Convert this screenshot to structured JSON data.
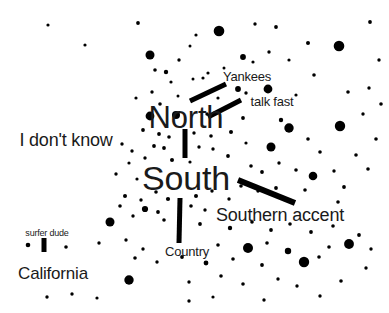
{
  "figure": {
    "title": "",
    "background_color": "#ffffff",
    "text_color": "#1a1a1a",
    "dot_color": "#000000",
    "line_color": "#000000",
    "width": 389,
    "height": 313
  },
  "chart_data": {
    "type": "scatter",
    "title": "",
    "subtitle": "",
    "xlabel": "",
    "ylabel": "",
    "xlim": [
      0,
      389
    ],
    "ylim": [
      0,
      313
    ],
    "grid": false,
    "legend": null,
    "annotations": [
      {
        "text": "North",
        "x": 186,
        "y": 117,
        "font_size": 31,
        "weight": 400
      },
      {
        "text": "South",
        "x": 186,
        "y": 178,
        "font_size": 34,
        "weight": 400
      },
      {
        "text": "Yankees",
        "x": 247,
        "y": 76,
        "font_size": 13,
        "weight": 400
      },
      {
        "text": "talk fast",
        "x": 272,
        "y": 101,
        "font_size": 13,
        "weight": 400
      },
      {
        "text": "Southern accent",
        "x": 280,
        "y": 215,
        "font_size": 18,
        "weight": 400
      },
      {
        "text": "I don't know",
        "x": 66,
        "y": 140,
        "font_size": 18,
        "weight": 400
      },
      {
        "text": "Country",
        "x": 187,
        "y": 251,
        "font_size": 13,
        "weight": 400
      },
      {
        "text": "California",
        "x": 53,
        "y": 273,
        "font_size": 17,
        "weight": 400
      },
      {
        "text": "surfer dude",
        "x": 47,
        "y": 233,
        "font_size": 9,
        "weight": 400
      }
    ],
    "leader_lines": [
      {
        "name": "yankees-leader",
        "x1": 190,
        "y1": 101,
        "x2": 226,
        "y2": 84,
        "width": 5
      },
      {
        "name": "talk-fast-leader",
        "x1": 208,
        "y1": 117,
        "x2": 241,
        "y2": 100,
        "width": 5
      },
      {
        "name": "north-south-leader",
        "x1": 185,
        "y1": 129,
        "x2": 185,
        "y2": 158,
        "width": 5
      },
      {
        "name": "southern-accent-leader",
        "x1": 238,
        "y1": 180,
        "x2": 295,
        "y2": 203,
        "width": 6
      },
      {
        "name": "country-leader",
        "x1": 180,
        "y1": 198,
        "x2": 179,
        "y2": 243,
        "width": 5
      },
      {
        "name": "surfer-dude-leader",
        "x1": 44,
        "y1": 238,
        "x2": 44,
        "y2": 252,
        "width": 5
      }
    ],
    "points": [
      {
        "x": 48,
        "y": 25,
        "r": 1.6
      },
      {
        "x": 85,
        "y": 45,
        "r": 1.6
      },
      {
        "x": 138,
        "y": 23,
        "r": 1.9
      },
      {
        "x": 150,
        "y": 55,
        "r": 4.5
      },
      {
        "x": 179,
        "y": 60,
        "r": 1.7
      },
      {
        "x": 196,
        "y": 35,
        "r": 1.6
      },
      {
        "x": 219,
        "y": 31,
        "r": 5.3
      },
      {
        "x": 166,
        "y": 72,
        "r": 2.2
      },
      {
        "x": 190,
        "y": 46,
        "r": 1.5
      },
      {
        "x": 203,
        "y": 78,
        "r": 1.6
      },
      {
        "x": 255,
        "y": 24,
        "r": 1.7
      },
      {
        "x": 276,
        "y": 27,
        "r": 1.9
      },
      {
        "x": 308,
        "y": 43,
        "r": 2.0
      },
      {
        "x": 339,
        "y": 46,
        "r": 5.3
      },
      {
        "x": 370,
        "y": 22,
        "r": 1.9
      },
      {
        "x": 243,
        "y": 57,
        "r": 2.9
      },
      {
        "x": 253,
        "y": 62,
        "r": 1.6
      },
      {
        "x": 269,
        "y": 52,
        "r": 1.7
      },
      {
        "x": 289,
        "y": 60,
        "r": 1.6
      },
      {
        "x": 314,
        "y": 75,
        "r": 1.8
      },
      {
        "x": 379,
        "y": 60,
        "r": 1.7
      },
      {
        "x": 155,
        "y": 70,
        "r": 1.8
      },
      {
        "x": 171,
        "y": 82,
        "r": 1.6
      },
      {
        "x": 193,
        "y": 79,
        "r": 1.5
      },
      {
        "x": 208,
        "y": 73,
        "r": 1.6
      },
      {
        "x": 224,
        "y": 68,
        "r": 1.5
      },
      {
        "x": 238,
        "y": 89,
        "r": 2.9
      },
      {
        "x": 246,
        "y": 93,
        "r": 1.7
      },
      {
        "x": 268,
        "y": 89,
        "r": 4.4
      },
      {
        "x": 152,
        "y": 92,
        "r": 1.7
      },
      {
        "x": 136,
        "y": 98,
        "r": 1.6
      },
      {
        "x": 160,
        "y": 104,
        "r": 1.8
      },
      {
        "x": 178,
        "y": 96,
        "r": 1.5
      },
      {
        "x": 218,
        "y": 98,
        "r": 1.6
      },
      {
        "x": 296,
        "y": 95,
        "r": 1.6
      },
      {
        "x": 348,
        "y": 92,
        "r": 1.8
      },
      {
        "x": 369,
        "y": 88,
        "r": 1.7
      },
      {
        "x": 381,
        "y": 104,
        "r": 1.8
      },
      {
        "x": 150,
        "y": 116,
        "r": 4.4
      },
      {
        "x": 176,
        "y": 115,
        "r": 4.0
      },
      {
        "x": 207,
        "y": 114,
        "r": 1.7
      },
      {
        "x": 243,
        "y": 118,
        "r": 1.9
      },
      {
        "x": 281,
        "y": 120,
        "r": 2.2
      },
      {
        "x": 289,
        "y": 128,
        "r": 4.7
      },
      {
        "x": 340,
        "y": 126,
        "r": 5.2
      },
      {
        "x": 363,
        "y": 114,
        "r": 1.7
      },
      {
        "x": 143,
        "y": 130,
        "r": 1.9
      },
      {
        "x": 159,
        "y": 134,
        "r": 1.9
      },
      {
        "x": 169,
        "y": 137,
        "r": 1.8
      },
      {
        "x": 194,
        "y": 133,
        "r": 1.7
      },
      {
        "x": 211,
        "y": 136,
        "r": 1.8
      },
      {
        "x": 231,
        "y": 132,
        "r": 2.0
      },
      {
        "x": 246,
        "y": 143,
        "r": 1.6
      },
      {
        "x": 271,
        "y": 147,
        "r": 4.5
      },
      {
        "x": 308,
        "y": 139,
        "r": 1.8
      },
      {
        "x": 376,
        "y": 139,
        "r": 1.8
      },
      {
        "x": 122,
        "y": 144,
        "r": 1.7
      },
      {
        "x": 132,
        "y": 151,
        "r": 1.7
      },
      {
        "x": 154,
        "y": 146,
        "r": 1.9
      },
      {
        "x": 164,
        "y": 148,
        "r": 1.9
      },
      {
        "x": 199,
        "y": 147,
        "r": 1.7
      },
      {
        "x": 213,
        "y": 149,
        "r": 1.7
      },
      {
        "x": 228,
        "y": 156,
        "r": 1.9
      },
      {
        "x": 320,
        "y": 152,
        "r": 1.8
      },
      {
        "x": 356,
        "y": 155,
        "r": 1.8
      },
      {
        "x": 129,
        "y": 163,
        "r": 1.6
      },
      {
        "x": 145,
        "y": 158,
        "r": 1.7
      },
      {
        "x": 172,
        "y": 160,
        "r": 2.0
      },
      {
        "x": 190,
        "y": 162,
        "r": 1.6
      },
      {
        "x": 251,
        "y": 166,
        "r": 1.8
      },
      {
        "x": 262,
        "y": 172,
        "r": 1.9
      },
      {
        "x": 279,
        "y": 163,
        "r": 1.7
      },
      {
        "x": 296,
        "y": 170,
        "r": 1.8
      },
      {
        "x": 313,
        "y": 176,
        "r": 4.3
      },
      {
        "x": 334,
        "y": 171,
        "r": 1.7
      },
      {
        "x": 368,
        "y": 169,
        "r": 1.8
      },
      {
        "x": 116,
        "y": 174,
        "r": 1.7
      },
      {
        "x": 137,
        "y": 179,
        "r": 1.6
      },
      {
        "x": 241,
        "y": 186,
        "r": 1.8
      },
      {
        "x": 258,
        "y": 191,
        "r": 1.7
      },
      {
        "x": 276,
        "y": 188,
        "r": 1.9
      },
      {
        "x": 305,
        "y": 190,
        "r": 1.8
      },
      {
        "x": 344,
        "y": 187,
        "r": 1.9
      },
      {
        "x": 125,
        "y": 196,
        "r": 2.0
      },
      {
        "x": 141,
        "y": 200,
        "r": 1.7
      },
      {
        "x": 156,
        "y": 192,
        "r": 1.8
      },
      {
        "x": 168,
        "y": 199,
        "r": 2.1
      },
      {
        "x": 196,
        "y": 196,
        "r": 2.0
      },
      {
        "x": 212,
        "y": 191,
        "r": 1.7
      },
      {
        "x": 229,
        "y": 199,
        "r": 1.7
      },
      {
        "x": 120,
        "y": 206,
        "r": 1.8
      },
      {
        "x": 145,
        "y": 209,
        "r": 3.1
      },
      {
        "x": 158,
        "y": 212,
        "r": 1.9
      },
      {
        "x": 191,
        "y": 206,
        "r": 1.8
      },
      {
        "x": 205,
        "y": 210,
        "r": 1.7
      },
      {
        "x": 338,
        "y": 202,
        "r": 1.8
      },
      {
        "x": 110,
        "y": 222,
        "r": 4.5
      },
      {
        "x": 133,
        "y": 216,
        "r": 1.7
      },
      {
        "x": 164,
        "y": 220,
        "r": 1.8
      },
      {
        "x": 200,
        "y": 224,
        "r": 1.9
      },
      {
        "x": 230,
        "y": 228,
        "r": 2.2
      },
      {
        "x": 252,
        "y": 222,
        "r": 1.8
      },
      {
        "x": 271,
        "y": 230,
        "r": 1.9
      },
      {
        "x": 290,
        "y": 224,
        "r": 1.8
      },
      {
        "x": 311,
        "y": 232,
        "r": 1.9
      },
      {
        "x": 333,
        "y": 226,
        "r": 1.8
      },
      {
        "x": 359,
        "y": 235,
        "r": 1.9
      },
      {
        "x": 28,
        "y": 245,
        "r": 2.3
      },
      {
        "x": 66,
        "y": 247,
        "r": 1.8
      },
      {
        "x": 99,
        "y": 243,
        "r": 1.7
      },
      {
        "x": 126,
        "y": 240,
        "r": 1.7
      },
      {
        "x": 143,
        "y": 249,
        "r": 1.7
      },
      {
        "x": 218,
        "y": 245,
        "r": 1.8
      },
      {
        "x": 248,
        "y": 248,
        "r": 5.0
      },
      {
        "x": 267,
        "y": 243,
        "r": 1.8
      },
      {
        "x": 288,
        "y": 251,
        "r": 3.2
      },
      {
        "x": 329,
        "y": 247,
        "r": 1.8
      },
      {
        "x": 349,
        "y": 244,
        "r": 4.9
      },
      {
        "x": 371,
        "y": 249,
        "r": 1.7
      },
      {
        "x": 135,
        "y": 258,
        "r": 1.8
      },
      {
        "x": 157,
        "y": 262,
        "r": 1.7
      },
      {
        "x": 182,
        "y": 257,
        "r": 1.9
      },
      {
        "x": 206,
        "y": 263,
        "r": 2.4
      },
      {
        "x": 233,
        "y": 259,
        "r": 1.8
      },
      {
        "x": 262,
        "y": 265,
        "r": 1.9
      },
      {
        "x": 304,
        "y": 262,
        "r": 5.2
      },
      {
        "x": 319,
        "y": 257,
        "r": 1.8
      },
      {
        "x": 366,
        "y": 268,
        "r": 1.7
      },
      {
        "x": 129,
        "y": 280,
        "r": 4.7
      },
      {
        "x": 189,
        "y": 282,
        "r": 1.7
      },
      {
        "x": 221,
        "y": 276,
        "r": 1.8
      },
      {
        "x": 243,
        "y": 284,
        "r": 1.8
      },
      {
        "x": 278,
        "y": 279,
        "r": 1.7
      },
      {
        "x": 297,
        "y": 286,
        "r": 1.7
      },
      {
        "x": 341,
        "y": 281,
        "r": 1.8
      },
      {
        "x": 47,
        "y": 297,
        "r": 1.7
      },
      {
        "x": 72,
        "y": 294,
        "r": 1.7
      },
      {
        "x": 97,
        "y": 298,
        "r": 1.6
      },
      {
        "x": 189,
        "y": 301,
        "r": 1.7
      },
      {
        "x": 213,
        "y": 297,
        "r": 1.6
      },
      {
        "x": 264,
        "y": 300,
        "r": 1.7
      },
      {
        "x": 320,
        "y": 296,
        "r": 1.7
      }
    ]
  }
}
